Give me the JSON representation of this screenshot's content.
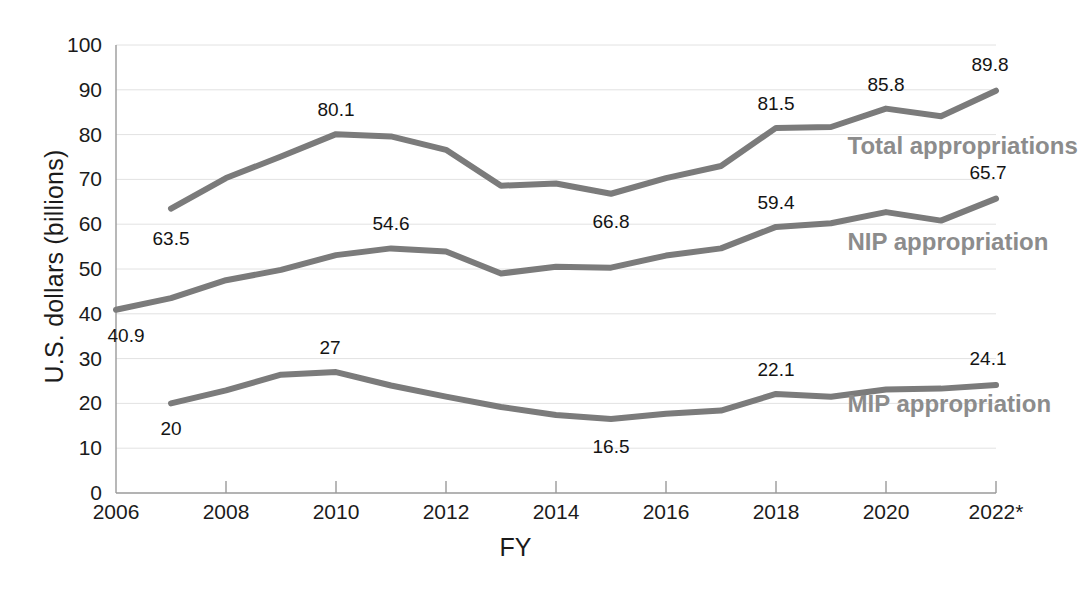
{
  "chart_data": {
    "type": "line",
    "title": "",
    "xlabel": "FY",
    "ylabel": "U.S. dollars (billions)",
    "ylim": [
      0,
      100
    ],
    "ytick_step": 10,
    "yticks": [
      "100",
      "90",
      "80",
      "70",
      "60",
      "50",
      "40",
      "30",
      "20",
      "10",
      "0"
    ],
    "xticks": [
      "2006",
      "2008",
      "2010",
      "2012",
      "2014",
      "2016",
      "2018",
      "2020",
      "2022*"
    ],
    "xlim": [
      2006,
      2022
    ],
    "grid": "horizontal",
    "legend_position": "inline-right",
    "x": [
      2006,
      2007,
      2008,
      2009,
      2010,
      2011,
      2012,
      2013,
      2014,
      2015,
      2016,
      2017,
      2018,
      2019,
      2020,
      2021,
      2022
    ],
    "series": [
      {
        "name": "Total appropriations",
        "color": "#7b7b7b",
        "values": [
          null,
          63.5,
          70.3,
          75.1,
          80.1,
          79.6,
          76.6,
          68.6,
          69.1,
          66.8,
          70.3,
          73.0,
          81.5,
          81.7,
          85.8,
          84.1,
          89.8
        ]
      },
      {
        "name": "NIP appropriation",
        "color": "#7b7b7b",
        "values": [
          40.9,
          43.5,
          47.5,
          49.8,
          53.1,
          54.6,
          53.9,
          49.0,
          50.5,
          50.3,
          53.0,
          54.6,
          59.4,
          60.2,
          62.7,
          60.8,
          65.7
        ]
      },
      {
        "name": "MIP appropriation",
        "color": "#7b7b7b",
        "values": [
          null,
          20.0,
          22.9,
          26.4,
          27.0,
          24.0,
          21.5,
          19.2,
          17.4,
          16.5,
          17.7,
          18.4,
          22.1,
          21.5,
          23.1,
          23.3,
          24.1
        ]
      }
    ],
    "point_labels": [
      {
        "series": "Total appropriations",
        "x": 2007,
        "value": "63.5",
        "dx": 0,
        "dy": 30
      },
      {
        "series": "Total appropriations",
        "x": 2010,
        "value": "80.1",
        "dx": 0,
        "dy": -24
      },
      {
        "series": "Total appropriations",
        "x": 2015,
        "value": "66.8",
        "dx": 0,
        "dy": 28
      },
      {
        "series": "Total appropriations",
        "x": 2018,
        "value": "81.5",
        "dx": 0,
        "dy": -24
      },
      {
        "series": "Total appropriations",
        "x": 2020,
        "value": "85.8",
        "dx": 0,
        "dy": -24
      },
      {
        "series": "Total appropriations",
        "x": 2022,
        "value": "89.8",
        "dx": -6,
        "dy": -26
      },
      {
        "series": "NIP appropriation",
        "x": 2006,
        "value": "40.9",
        "dx": 10,
        "dy": 26
      },
      {
        "series": "NIP appropriation",
        "x": 2011,
        "value": "54.6",
        "dx": 0,
        "dy": -24
      },
      {
        "series": "NIP appropriation",
        "x": 2018,
        "value": "59.4",
        "dx": 0,
        "dy": -24
      },
      {
        "series": "NIP appropriation",
        "x": 2022,
        "value": "65.7",
        "dx": -8,
        "dy": -26
      },
      {
        "series": "MIP appropriation",
        "x": 2007,
        "value": "20",
        "dx": 0,
        "dy": 26
      },
      {
        "series": "MIP appropriation",
        "x": 2010,
        "value": "27",
        "dx": -6,
        "dy": -24
      },
      {
        "series": "MIP appropriation",
        "x": 2015,
        "value": "16.5",
        "dx": 0,
        "dy": 28
      },
      {
        "series": "MIP appropriation",
        "x": 2018,
        "value": "22.1",
        "dx": 0,
        "dy": -24
      },
      {
        "series": "MIP appropriation",
        "x": 2022,
        "value": "24.1",
        "dx": -8,
        "dy": -26
      }
    ],
    "series_labels": [
      {
        "name": "Total appropriations",
        "x": 2019.3,
        "y": 77.5
      },
      {
        "name": "NIP appropriation",
        "x": 2019.3,
        "y": 56.0
      },
      {
        "name": "MIP appropriation",
        "x": 2019.3,
        "y": 19.8
      }
    ],
    "axis_color": "#9a9a9a",
    "grid_color": "#e2e2e2",
    "text_color": "#1b1b1b"
  }
}
